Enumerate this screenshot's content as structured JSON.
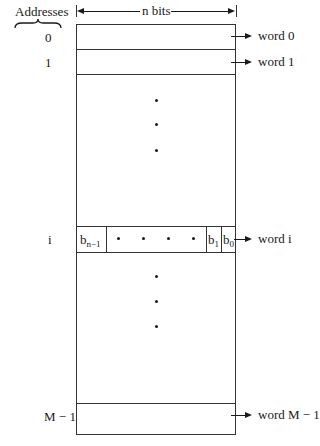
{
  "header": {
    "addresses_label": "Addresses",
    "width_label": "n bits"
  },
  "addresses": {
    "a0": "0",
    "a1": "1",
    "ai": "i",
    "alast": "M − 1"
  },
  "words": {
    "w0": "word 0",
    "w1": "word 1",
    "wi": "word i",
    "wlast": "word M − 1"
  },
  "bits": {
    "msb_base": "b",
    "msb_sub": "n−1",
    "b1_base": "b",
    "b1_sub": "1",
    "b0_base": "b",
    "b0_sub": "0"
  }
}
